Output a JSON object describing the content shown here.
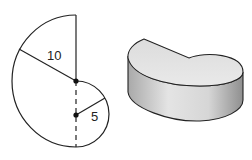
{
  "figure": {
    "net": {
      "large_radius_label": "10",
      "small_radius_label": "5"
    },
    "solid": {
      "description": "3D solid formed from the flat shape"
    }
  },
  "colors": {
    "stroke": "#222222",
    "solid_light": "#e6e6e6",
    "solid_dark": "#9a9a9a"
  }
}
